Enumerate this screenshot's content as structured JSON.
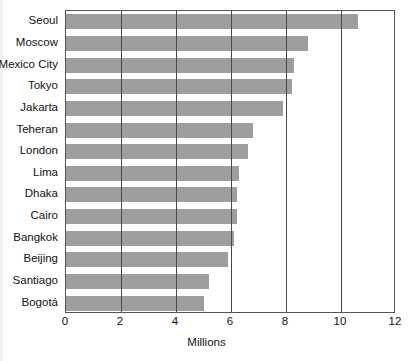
{
  "chart_data": {
    "type": "bar",
    "orientation": "horizontal",
    "title": "",
    "xlabel": "Millions",
    "ylabel": "",
    "xlim": [
      0,
      12
    ],
    "xticks": [
      "0",
      "2",
      "4",
      "6",
      "8",
      "10",
      "12"
    ],
    "xtick_values": [
      0,
      2,
      4,
      6,
      8,
      10,
      12
    ],
    "grid": "vertical gridlines at every x tick",
    "legend": "none",
    "bar_color": "#9e9e9e",
    "frame_color": "#555555",
    "categories": [
      "Seoul",
      "Moscow",
      "Mexico City",
      "Tokyo",
      "Jakarta",
      "Teheran",
      "London",
      "Lima",
      "Dhaka",
      "Cairo",
      "Bangkok",
      "Beijing",
      "Santiago",
      "Bogotá"
    ],
    "values": [
      10.6,
      8.8,
      8.3,
      8.2,
      7.9,
      6.8,
      6.6,
      6.3,
      6.2,
      6.2,
      6.1,
      5.9,
      5.2,
      5.0
    ]
  }
}
